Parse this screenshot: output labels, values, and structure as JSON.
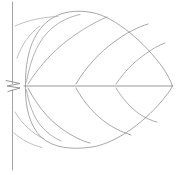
{
  "image": {
    "title": "Leaf line drawing",
    "subject": "leaf",
    "style": "faint pencil line sketch",
    "width": 178,
    "height": 175,
    "background_color": "#ffffff",
    "ink_color": "#8f8f8f",
    "ink_color_light": "#b4b4b4",
    "ink_color_dark": "#6e6e6e"
  },
  "drawing": {
    "type": "line-art",
    "parts": [
      {
        "name": "stem-axis",
        "label": "vertical stem axis",
        "color": "#9a9a9a",
        "width": 0.9,
        "path": "M 12.5 2 L 12.5 83.5 M 12.5 90 L 12.5 170"
      },
      {
        "name": "stem-node-zigzag",
        "label": "zigzag node mark",
        "color": "#8a8a8a",
        "width": 0.9,
        "path": "M 6 80.5 L 20 83.5 L 7 86 L 20 88 L 8 91.5"
      },
      {
        "name": "leaf-outline-upper",
        "label": "upper blade margin",
        "color": "#9d9d9d",
        "width": 0.9,
        "path": "M 25.5 86 C 25 55 33 33 48 21 C 60 11.5 76 9.5 92 12.5 C 116 17 146 44 163 68 C 168 75 171 82 172.5 86"
      },
      {
        "name": "leaf-outline-lower",
        "label": "lower blade margin",
        "color": "#9d9d9d",
        "width": 0.9,
        "path": "M 25.5 86 C 25 108 30 126 41 137 C 53 148 72 150 92 147 C 118 143 148 119 165 97 C 169 92 171.5 88.5 172.5 86"
      },
      {
        "name": "midrib",
        "label": "midrib primary vein",
        "color": "#8d8d8d",
        "width": 0.9,
        "path": "M 24 86 L 172.5 86"
      },
      {
        "name": "vein-upper-1",
        "label": "upper secondary vein 1",
        "color": "#9f9f9f",
        "width": 0.8,
        "path": "M 26.5 82 C 30 62 36 45 47 33 C 56 23 68 17 80 14.5"
      },
      {
        "name": "vein-upper-2",
        "label": "upper secondary vein 2",
        "color": "#9a9a9a",
        "width": 0.8,
        "path": "M 28 84 C 38 68 52 52 68 40 C 82 29.5 95 22 107 17"
      },
      {
        "name": "vein-upper-3",
        "label": "upper secondary vein 3",
        "color": "#8f8f8f",
        "width": 0.8,
        "path": "M 76 84 C 86 67 100 52 114 42 C 126 33 138 27 148 24"
      },
      {
        "name": "vein-upper-4",
        "label": "upper secondary vein 4",
        "color": "#979797",
        "width": 0.8,
        "path": "M 116 84 C 124 72 134 62 144 55 C 152 49 159 45 165 43"
      },
      {
        "name": "vein-lower-1",
        "label": "lower secondary vein 1",
        "color": "#9f9f9f",
        "width": 0.8,
        "path": "M 26.5 90 C 29 104 33 116 41 126 C 47 133 54 138 61 141"
      },
      {
        "name": "vein-lower-2",
        "label": "lower secondary vein 2",
        "color": "#8f8f8f",
        "width": 0.8,
        "path": "M 28 88 C 36 104 48 119 62 129 C 72 136 82 141 90 143"
      },
      {
        "name": "vein-lower-3",
        "label": "lower secondary vein 3",
        "color": "#8f8f8f",
        "width": 0.8,
        "path": "M 76 88 C 84 103 96 116 108 124 C 117 130 125 133 131 135"
      },
      {
        "name": "vein-lower-4",
        "label": "lower secondary vein 4",
        "color": "#979797",
        "width": 0.8,
        "path": "M 116 88 C 122 98 130 107 138 113 C 145 118 152 121 157 122"
      },
      {
        "name": "marginal-arc-upper-left",
        "label": "upper left marginal arc",
        "color": "#b0b0b0",
        "width": 0.8,
        "path": "M 17 58 C 22 44 30 33 40 26"
      },
      {
        "name": "marginal-arc-upper-left-2",
        "label": "upper left marginal arc short",
        "color": "#b0b0b0",
        "width": 0.8,
        "path": "M 15 26 C 28 20 44 17 58 16.5"
      },
      {
        "name": "marginal-arc-lower-left",
        "label": "lower left marginal arc",
        "color": "#b0b0b0",
        "width": 0.8,
        "path": "M 15 112 C 22 124 32 133 44 139"
      },
      {
        "name": "marginal-arc-lower-left-2",
        "label": "lower left marginal arc short",
        "color": "#b0b0b0",
        "width": 0.8,
        "path": "M 14 133 C 22 140 32 145 42 147.5"
      }
    ]
  }
}
